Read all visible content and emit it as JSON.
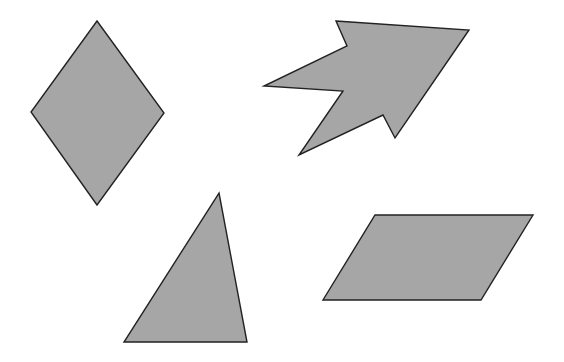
{
  "canvas": {
    "width": 564,
    "height": 362,
    "background": "#ffffff"
  },
  "style": {
    "fill": "#a6a6a6",
    "stroke": "#222222"
  },
  "shapes": [
    {
      "name": "rhombus",
      "points": "97,21 164,113 97,205 31,112"
    },
    {
      "name": "arrow",
      "points": "336,21 469,30 395,138 383,115 299,155 343,91 264,86 347,46"
    },
    {
      "name": "triangle",
      "points": "219,193 247,342 124,342"
    },
    {
      "name": "parallelogram",
      "points": "375,215 533,215 481,300 323,300"
    }
  ]
}
